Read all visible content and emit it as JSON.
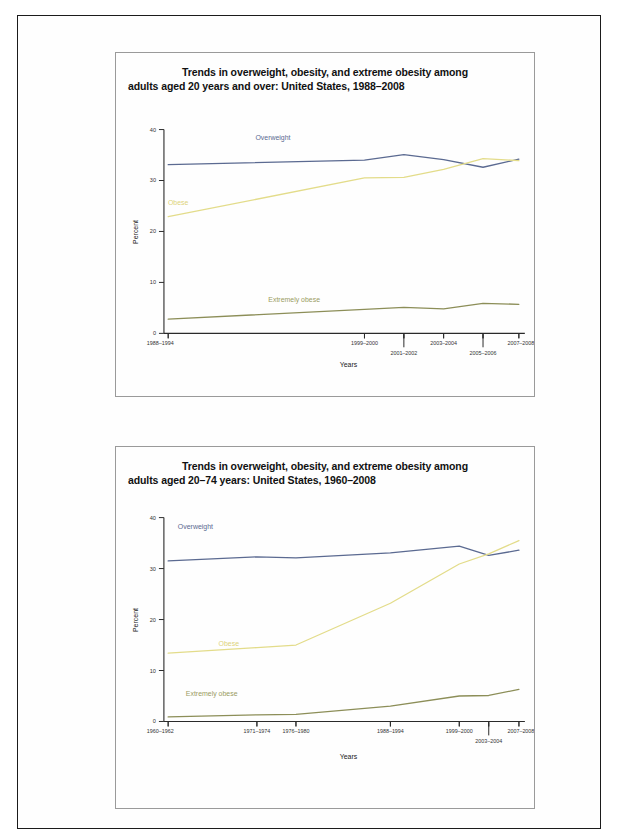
{
  "page": {
    "background_color": "#ffffff",
    "border_color": "#1b1b1b"
  },
  "colors": {
    "overweight": "#5b6a91",
    "obese": "#e3dc8a",
    "extremely_obese": "#8c8e58",
    "axis": "#2a2a2a",
    "text": "#222222"
  },
  "figures": [
    {
      "id": "figure-1",
      "title_line1": "Trends in overweight, obesity, and extreme obesity among",
      "title_line2": "adults aged 20 years and over: United States, 1988–2008",
      "xlabel": "Years",
      "ylabel": "Percent",
      "ytick_labels": [
        "0",
        "10",
        "20",
        "30",
        "40"
      ],
      "xtick_labels": [
        "1988–1994",
        "1999–2000",
        "2001–2002",
        "2003–2004",
        "2005–2006",
        "2007–2008"
      ],
      "series_labels": {
        "overweight": "Overweight",
        "obese": "Obese",
        "extremely_obese": "Extremely obese"
      }
    },
    {
      "id": "figure-2",
      "title_line1": "Trends in overweight, obesity, and extreme obesity among",
      "title_line2": "adults aged 20–74 years: United States, 1960–2008",
      "xlabel": "Years",
      "ylabel": "Percent",
      "ytick_labels": [
        "0",
        "10",
        "20",
        "30",
        "40"
      ],
      "xtick_labels": [
        "1960–1962",
        "1971–1974",
        "1976–1980",
        "1988–1994",
        "1999–2000",
        "2003–2004",
        "2007–2008"
      ],
      "series_labels": {
        "overweight": "Overweight",
        "obese": "Obese",
        "extremely_obese": "Extremely obese"
      }
    }
  ],
  "chart_data": [
    {
      "type": "line",
      "title": "Trends in overweight, obesity, and extreme obesity among adults aged 20 years and over: United States, 1988–2008",
      "xlabel": "Years",
      "ylabel": "Percent",
      "ylim": [
        0,
        40
      ],
      "yticks": [
        0,
        10,
        20,
        30,
        40
      ],
      "grid": false,
      "legend": "inline-labels",
      "categories": [
        "1988–1994",
        "1999–2000",
        "2001–2002",
        "2003–2004",
        "2005–2006",
        "2007–2008"
      ],
      "series": [
        {
          "name": "Overweight",
          "color": "#5b6a91",
          "values": [
            33.1,
            34.0,
            35.1,
            34.1,
            32.6,
            34.2
          ]
        },
        {
          "name": "Obese",
          "color": "#e3dc8a",
          "values": [
            22.9,
            30.5,
            30.6,
            32.2,
            34.3,
            33.9
          ]
        },
        {
          "name": "Extremely obese",
          "color": "#8c8e58",
          "values": [
            2.8,
            4.7,
            5.1,
            4.8,
            5.9,
            5.7
          ]
        }
      ]
    },
    {
      "type": "line",
      "title": "Trends in overweight, obesity, and extreme obesity among adults aged 20–74 years: United States, 1960–2008",
      "xlabel": "Years",
      "ylabel": "Percent",
      "ylim": [
        0,
        40
      ],
      "yticks": [
        0,
        10,
        20,
        30,
        40
      ],
      "grid": false,
      "legend": "inline-labels",
      "categories": [
        "1960–1962",
        "1971–1974",
        "1976–1980",
        "1988–1994",
        "1999–2000",
        "2003–2004",
        "2007–2008"
      ],
      "series": [
        {
          "name": "Overweight",
          "color": "#5b6a91",
          "values": [
            31.5,
            32.3,
            32.1,
            33.1,
            34.4,
            32.6,
            33.6
          ]
        },
        {
          "name": "Obese",
          "color": "#e3dc8a",
          "values": [
            13.4,
            14.5,
            15.0,
            23.2,
            30.9,
            32.9,
            35.5
          ]
        },
        {
          "name": "Extremely obese",
          "color": "#8c8e58",
          "values": [
            0.9,
            1.3,
            1.4,
            3.0,
            5.0,
            5.1,
            6.3
          ]
        }
      ]
    }
  ]
}
